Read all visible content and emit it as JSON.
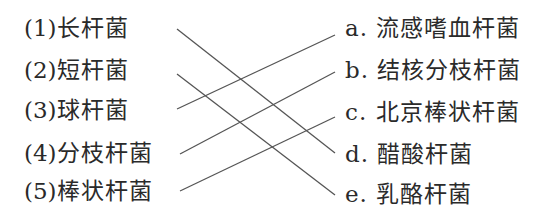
{
  "left_items": [
    {
      "num": "(1)",
      "label": "长杆菌"
    },
    {
      "num": "(2)",
      "label": "短杆菌"
    },
    {
      "num": "(3)",
      "label": "球杆菌"
    },
    {
      "num": "(4)",
      "label": "分枝杆菌"
    },
    {
      "num": "(5)",
      "label": "棒状杆菌"
    }
  ],
  "right_items": [
    {
      "letter": "a.",
      "label": "流感嗜血杆菌"
    },
    {
      "letter": "b.",
      "label": "结核分枝杆菌"
    },
    {
      "letter": "c.",
      "label": "北京棒状杆菌"
    },
    {
      "letter": "d.",
      "label": "醋酸杆菌"
    },
    {
      "letter": "e.",
      "label": "乳酪杆菌"
    }
  ],
  "connections": [
    {
      "from": "(1)",
      "to": "d."
    },
    {
      "from": "(2)",
      "to": "e."
    },
    {
      "from": "(3)",
      "to": "a."
    },
    {
      "from": "(4)",
      "to": "b."
    },
    {
      "from": "(5)",
      "to": "c."
    }
  ]
}
